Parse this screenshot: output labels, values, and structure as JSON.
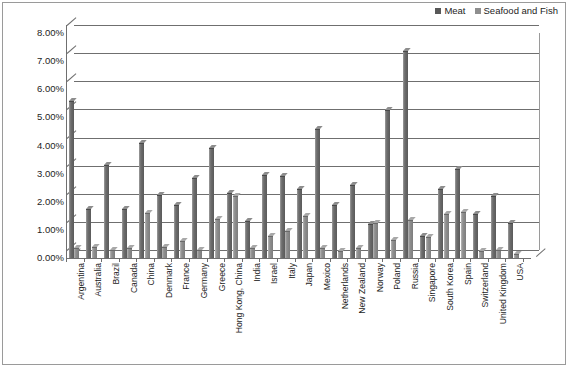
{
  "chart_data": {
    "type": "bar",
    "title": "",
    "subtitle": "",
    "xlabel": "",
    "ylabel": "",
    "ylim": [
      0,
      8
    ],
    "y_tick_labels": [
      "0.00%",
      "1.00%",
      "2.00%",
      "3.00%",
      "4.00%",
      "5.00%",
      "6.00%",
      "7.00%",
      "8.00%"
    ],
    "y_tick_values": [
      0,
      1,
      2,
      3,
      4,
      5,
      6,
      7,
      8
    ],
    "grid": true,
    "legend_position": "top-right",
    "value_suffix": "%",
    "categories": [
      "Argentina",
      "Australia",
      "Brazil",
      "Canada",
      "China",
      "Denmark",
      "France",
      "Germany",
      "Greece",
      "Hong Kong, China",
      "India",
      "Israel",
      "Italy",
      "Japan",
      "Mexico",
      "Netherlands",
      "New Zealand",
      "Norway",
      "Poland",
      "Russia",
      "Singapore",
      "South Korea",
      "Spain",
      "Switzerland",
      "United Kingdom",
      "USA"
    ],
    "series": [
      {
        "name": "Meat",
        "color": "#5a5a5a",
        "values": [
          5.6,
          1.75,
          3.3,
          1.75,
          4.1,
          2.25,
          1.9,
          2.85,
          3.9,
          2.3,
          1.3,
          2.95,
          2.9,
          2.45,
          4.6,
          1.9,
          2.6,
          1.2,
          5.25,
          7.35,
          0.8,
          2.45,
          3.15,
          1.55,
          2.2,
          1.25
        ]
      },
      {
        "name": "Seafood and Fish",
        "color": "#8e8e8e",
        "values": [
          0.35,
          0.4,
          0.3,
          0.35,
          1.6,
          0.4,
          0.6,
          0.3,
          1.4,
          2.2,
          0.35,
          0.8,
          0.95,
          1.5,
          0.35,
          0.25,
          0.35,
          1.25,
          0.65,
          1.35,
          0.75,
          1.55,
          1.65,
          0.25,
          0.3,
          0.15
        ]
      }
    ]
  },
  "legend": {
    "entries": [
      {
        "label": "Meat",
        "swatch": "meat-swatch"
      },
      {
        "label": "Seafood and Fish",
        "swatch": "seafood-swatch"
      }
    ]
  }
}
